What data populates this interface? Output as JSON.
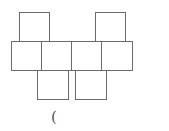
{
  "diagram": {
    "type": "cube-net",
    "line_color": "#6b6b6b",
    "squares": [
      {
        "id": "top-left",
        "x": 19,
        "y": 12,
        "w": 31,
        "h": 30
      },
      {
        "id": "top-right",
        "x": 95,
        "y": 12,
        "w": 31,
        "h": 30
      },
      {
        "id": "mid-1",
        "x": 11,
        "y": 41,
        "w": 31,
        "h": 30
      },
      {
        "id": "mid-2",
        "x": 41,
        "y": 41,
        "w": 31,
        "h": 30
      },
      {
        "id": "mid-3",
        "x": 71,
        "y": 41,
        "w": 31,
        "h": 30
      },
      {
        "id": "mid-4",
        "x": 101,
        "y": 41,
        "w": 32,
        "h": 30
      },
      {
        "id": "bottom-left",
        "x": 37,
        "y": 70,
        "w": 32,
        "h": 30
      },
      {
        "id": "bottom-right",
        "x": 75,
        "y": 70,
        "w": 32,
        "h": 30
      }
    ],
    "caption": "("
  }
}
